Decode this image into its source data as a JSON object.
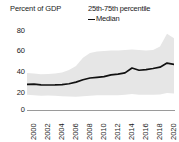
{
  "chart_data": {
    "type": "line",
    "title": "",
    "ylabel": "Percent of GDP",
    "xlabel": "",
    "ylim": [
      0,
      80
    ],
    "xlim": [
      2000,
      2021
    ],
    "grid": false,
    "legend_position": "top-right",
    "yticks": [
      "80",
      "60",
      "40",
      "20",
      "0"
    ],
    "ytick_values": [
      80,
      60,
      40,
      20,
      0
    ],
    "xticks": [
      "2000",
      "2002",
      "2004",
      "2006",
      "2008",
      "2010",
      "2012",
      "2014",
      "2016",
      "2018",
      "2020"
    ],
    "xtick_values": [
      2000,
      2002,
      2004,
      2006,
      2008,
      2010,
      2012,
      2014,
      2016,
      2018,
      2020
    ],
    "legend": [
      {
        "label": "25th-75th percentile",
        "marker": "band",
        "color": "#e3e3e3"
      },
      {
        "label": "Median",
        "marker": "line",
        "color": "#111111"
      }
    ],
    "x": [
      2000,
      2001,
      2002,
      2003,
      2004,
      2005,
      2006,
      2007,
      2008,
      2009,
      2010,
      2011,
      2012,
      2013,
      2014,
      2015,
      2016,
      2017,
      2018,
      2019,
      2020,
      2021
    ],
    "series": [
      {
        "name": "Median",
        "color": "#111111",
        "values": [
          25.0,
          25.2,
          24.5,
          24.4,
          24.5,
          24.8,
          25.6,
          27.2,
          29.5,
          31.2,
          31.8,
          32.5,
          34.2,
          35.0,
          36.2,
          41.0,
          38.8,
          39.4,
          40.5,
          41.8,
          45.8,
          44.5
        ]
      },
      {
        "name": "75th percentile",
        "color": "#e3e3e3",
        "values": [
          36.0,
          35.5,
          35.0,
          35.2,
          35.5,
          36.5,
          39.0,
          43.0,
          51.0,
          55.5,
          57.0,
          57.5,
          58.0,
          58.0,
          58.5,
          59.0,
          58.5,
          58.0,
          58.5,
          62.0,
          74.5,
          70.0
        ]
      },
      {
        "name": "25th percentile",
        "color": "#e3e3e3",
        "values": [
          15.0,
          14.5,
          14.0,
          14.2,
          14.0,
          13.5,
          13.2,
          13.0,
          13.5,
          14.0,
          14.5,
          14.5,
          14.5,
          14.5,
          14.8,
          15.5,
          15.0,
          14.8,
          15.0,
          15.2,
          16.5,
          16.0
        ]
      }
    ],
    "band_color": "#e6e6e6",
    "median_color": "#111111",
    "axis_color": "#9a9a9a"
  }
}
